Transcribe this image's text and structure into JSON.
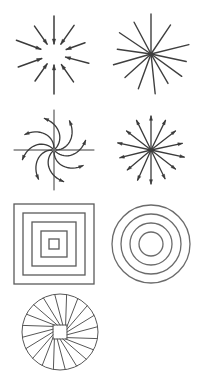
{
  "sheet": {
    "title": "Radial and concentric pattern figure sheet",
    "background_color": "#ffffff",
    "columns": 2,
    "rows": 4,
    "figure_count": 7
  },
  "colors": {
    "arrow_stroke": "#3b3b3b",
    "line_stroke": "#3f3f3f",
    "square_stroke": "#5a5a5a",
    "circle_stroke": "#6b6b6b",
    "fan_stroke": "#575757",
    "background": "#ffffff"
  },
  "figures": [
    {
      "id": "converging-arrows",
      "name": "converging-arrows",
      "label": "Converging arrows",
      "description": "Straight arrows of varying length pointing inward toward a common center",
      "type": "radial-arrows",
      "direction": "inward",
      "arrow_count": 10,
      "stroke": "#3b3b3b",
      "stroke_width": 1.5,
      "center": {
        "x": 46,
        "y": 46
      },
      "grid_position": {
        "row": 1,
        "col": 1
      },
      "rays": [
        {
          "angle_deg": 90,
          "start_radius": 38,
          "end_radius": 10
        },
        {
          "angle_deg": 125,
          "start_radius": 34,
          "end_radius": 12
        },
        {
          "angle_deg": 160,
          "start_radius": 40,
          "end_radius": 14
        },
        {
          "angle_deg": 200,
          "start_radius": 38,
          "end_radius": 13
        },
        {
          "angle_deg": 235,
          "start_radius": 33,
          "end_radius": 12
        },
        {
          "angle_deg": 270,
          "start_radius": 40,
          "end_radius": 11
        },
        {
          "angle_deg": 305,
          "start_radius": 34,
          "end_radius": 13
        },
        {
          "angle_deg": 345,
          "start_radius": 36,
          "end_radius": 12
        },
        {
          "angle_deg": 20,
          "start_radius": 33,
          "end_radius": 13
        },
        {
          "angle_deg": 55,
          "start_radius": 35,
          "end_radius": 12
        }
      ]
    },
    {
      "id": "line-starburst",
      "name": "line-starburst",
      "label": "Line starburst",
      "description": "Plain straight lines of varying length radiating from a single dense center point, no arrowheads",
      "type": "radial-lines",
      "direction": "none",
      "ray_count": 13,
      "stroke": "#3f3f3f",
      "stroke_width": 1.4,
      "center": {
        "x": 46,
        "y": 46
      },
      "grid_position": {
        "row": 1,
        "col": 2
      },
      "rays": [
        {
          "angle_deg": 90,
          "length": 40
        },
        {
          "angle_deg": 118,
          "length": 36
        },
        {
          "angle_deg": 146,
          "length": 38
        },
        {
          "angle_deg": 172,
          "length": 34
        },
        {
          "angle_deg": 196,
          "length": 39
        },
        {
          "angle_deg": 222,
          "length": 35
        },
        {
          "angle_deg": 250,
          "length": 37
        },
        {
          "angle_deg": 276,
          "length": 40
        },
        {
          "angle_deg": 300,
          "length": 34
        },
        {
          "angle_deg": 324,
          "length": 38
        },
        {
          "angle_deg": 348,
          "length": 36
        },
        {
          "angle_deg": 14,
          "length": 39
        },
        {
          "angle_deg": 56,
          "length": 35
        }
      ]
    },
    {
      "id": "spiral-pinwheel",
      "name": "spiral-pinwheel",
      "label": "Spiral pinwheel arrows",
      "description": "Curved arrows spiralling counter-clockwise outward from the center, overlaid on a straight vertical and horizontal cross axis",
      "type": "curved-radial-arrows",
      "direction": "outward-spiral",
      "arm_count": 8,
      "has_cross_axes": true,
      "stroke": "#3b3b3b",
      "stroke_width": 1.3,
      "center": {
        "x": 46,
        "y": 46
      },
      "grid_position": {
        "row": 2,
        "col": 1
      },
      "arms": [
        {
          "angle_deg": 0
        },
        {
          "angle_deg": 45
        },
        {
          "angle_deg": 90
        },
        {
          "angle_deg": 135
        },
        {
          "angle_deg": 180
        },
        {
          "angle_deg": 225
        },
        {
          "angle_deg": 270
        },
        {
          "angle_deg": 315
        }
      ]
    },
    {
      "id": "diverging-arrows",
      "name": "diverging-arrows",
      "label": "Diverging arrows",
      "description": "Straight arrows radiating outward from a common center point, arrowheads at the outer ends",
      "type": "radial-arrows",
      "direction": "outward",
      "arrow_count": 14,
      "stroke": "#3b3b3b",
      "stroke_width": 1.3,
      "center": {
        "x": 46,
        "y": 46
      },
      "grid_position": {
        "row": 2,
        "col": 2
      },
      "rays": [
        {
          "angle_deg": 90,
          "length": 34
        },
        {
          "angle_deg": 116,
          "length": 33
        },
        {
          "angle_deg": 142,
          "length": 31
        },
        {
          "angle_deg": 168,
          "length": 34
        },
        {
          "angle_deg": 194,
          "length": 32
        },
        {
          "angle_deg": 220,
          "length": 31
        },
        {
          "angle_deg": 246,
          "length": 33
        },
        {
          "angle_deg": 270,
          "length": 34
        },
        {
          "angle_deg": 296,
          "length": 32
        },
        {
          "angle_deg": 322,
          "length": 31
        },
        {
          "angle_deg": 348,
          "length": 34
        },
        {
          "angle_deg": 12,
          "length": 32
        },
        {
          "angle_deg": 38,
          "length": 31
        },
        {
          "angle_deg": 64,
          "length": 33
        }
      ]
    },
    {
      "id": "concentric-squares",
      "name": "concentric-squares",
      "label": "Concentric squares",
      "description": "Five nested squares sharing a common center, evenly spaced",
      "type": "concentric-squares",
      "ring_count": 5,
      "stroke": "#5a5a5a",
      "stroke_width": 1.3,
      "center": {
        "x": 42,
        "y": 42
      },
      "grid_position": {
        "row": 3,
        "col": 1
      },
      "half_sizes": [
        40,
        31,
        22,
        13,
        5
      ]
    },
    {
      "id": "concentric-circles",
      "name": "concentric-circles",
      "label": "Concentric circles",
      "description": "Four nested circles sharing a common center, evenly spaced",
      "type": "concentric-circles",
      "ring_count": 4,
      "stroke": "#6b6b6b",
      "stroke_width": 1.3,
      "center": {
        "x": 42,
        "y": 42
      },
      "grid_position": {
        "row": 3,
        "col": 2
      },
      "radii": [
        39,
        30,
        21,
        12
      ]
    },
    {
      "id": "spiral-fan",
      "name": "spiral-fan",
      "label": "Spiral fan",
      "description": "A circle filled with straight chords spiralling out from an off-center inner square, producing a whirl or fan effect; partially cropped at the bottom edge of the sheet",
      "type": "spiral-fan",
      "spoke_count": 20,
      "has_inner_square": true,
      "cropped": true,
      "stroke": "#575757",
      "stroke_width": 1.0,
      "center": {
        "x": 40,
        "y": 40
      },
      "outer_radius": 38,
      "inner_square_half": 7,
      "grid_position": {
        "row": 4,
        "col": 1
      }
    }
  ]
}
